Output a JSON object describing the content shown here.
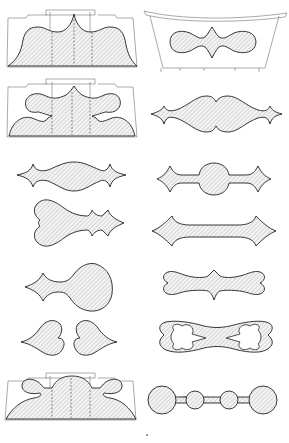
{
  "plate": {
    "background": "#ffffff",
    "ink_color": "#222222",
    "hatch_color": "#9a9a9a",
    "layout": "two-column grid of ornamental cutout patterns",
    "figures": [
      {
        "id": 1,
        "column": "left",
        "row": 1,
        "kind": "chair-back-splat-with-scalloped-cutout"
      },
      {
        "id": 2,
        "column": "right",
        "row": 1,
        "kind": "bench-apron-with-double-lobe-cutout"
      },
      {
        "id": 3,
        "column": "left",
        "row": 2,
        "kind": "chair-back-splat-with-scroll-cutouts"
      },
      {
        "id": 4,
        "column": "right",
        "row": 2,
        "kind": "double-swell-cutout-with-pointed-ends"
      },
      {
        "id": 5,
        "column": "left",
        "row": 3,
        "kind": "single-swell-cutout-with-pointed-ends"
      },
      {
        "id": 6,
        "column": "right",
        "row": 3,
        "kind": "round-center-cutout-with-diamond-ends"
      },
      {
        "id": 7,
        "column": "left",
        "row": 4,
        "kind": "heart-end-cutout-with-pointed-tip"
      },
      {
        "id": 8,
        "column": "right",
        "row": 4,
        "kind": "narrow-bar-cutout-with-pointed-ends"
      },
      {
        "id": 9,
        "column": "left",
        "row": 5,
        "kind": "teardrop-cutout-with-pointed-tip"
      },
      {
        "id": 10,
        "column": "right",
        "row": 5,
        "kind": "bone-cutout-with-center-point"
      },
      {
        "id": 11,
        "column": "left",
        "row": 6,
        "kind": "pair-of-heart-cutouts"
      },
      {
        "id": 12,
        "column": "right",
        "row": 6,
        "kind": "double-heart-ring-cutout"
      },
      {
        "id": 13,
        "column": "left",
        "row": 7,
        "kind": "chair-back-splat-with-arched-cutout"
      },
      {
        "id": 14,
        "column": "right",
        "row": 7,
        "kind": "four-circle-chain-cutout"
      }
    ]
  },
  "page_mark": "·"
}
